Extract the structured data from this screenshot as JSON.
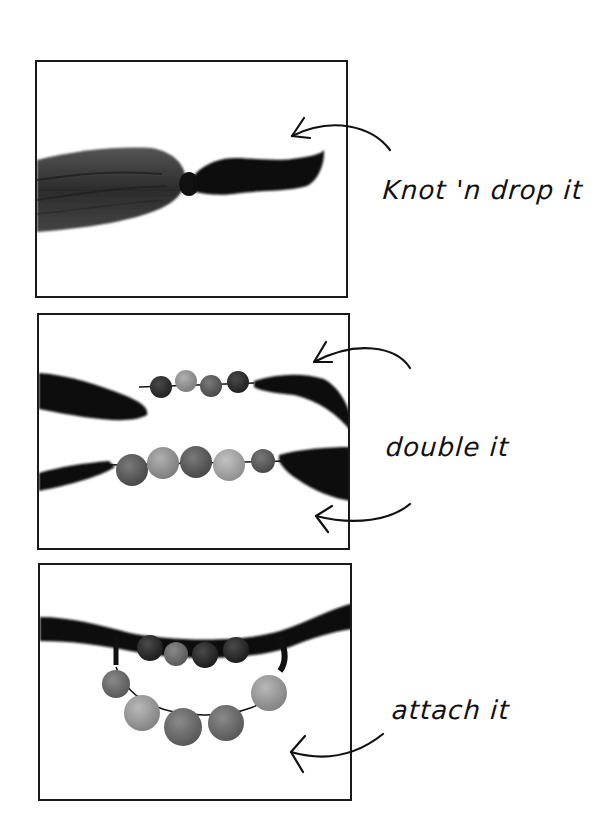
{
  "steps": [
    {
      "caption": "Knot 'n drop it"
    },
    {
      "caption": "double it"
    },
    {
      "caption": "attach it"
    }
  ],
  "colors": {
    "ink": "#111111",
    "fabric_dark": "#151515",
    "fabric_mid": "#3a3a3a",
    "bead_dark": "#2b2b2b",
    "bead_mid": "#5a5a5a",
    "bead_light": "#8a8a8a",
    "bead_lighter": "#a3a3a3",
    "frame": "#1a1a1a",
    "background": "#ffffff"
  }
}
